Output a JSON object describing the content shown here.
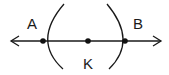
{
  "diagram": {
    "type": "geometric-construction",
    "line": {
      "x1": 11,
      "y1": 41,
      "x2": 161,
      "y2": 41,
      "arrows": "both"
    },
    "points": [
      {
        "id": "A",
        "label": "A",
        "x": 43,
        "y": 41,
        "label_x": 32,
        "label_y": 29
      },
      {
        "id": "K",
        "label": "K",
        "x": 88,
        "y": 41,
        "label_x": 88,
        "label_y": 69
      },
      {
        "id": "B",
        "label": "B",
        "x": 125,
        "y": 41,
        "label_x": 138,
        "label_y": 29
      }
    ],
    "arcs": [
      {
        "id": "left-arc",
        "from": [
          64,
          4
        ],
        "through": [
          43,
          41
        ],
        "to": [
          63,
          69
        ]
      },
      {
        "id": "right-arc",
        "from": [
          107,
          4
        ],
        "through": [
          125,
          41
        ],
        "to": [
          109,
          69
        ]
      }
    ],
    "colors": {
      "stroke": "#1a1a1a",
      "background": "#ffffff"
    }
  },
  "labels": {
    "a": "A",
    "b": "B",
    "k": "K"
  }
}
